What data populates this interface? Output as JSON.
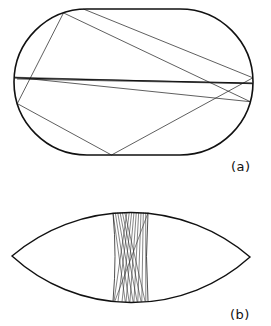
{
  "figure": {
    "panels": [
      {
        "id": "a",
        "label": "(a)",
        "description": "Stadium billiard with chaotic (ergodic) ray trajectories",
        "boundary": {
          "shape": "stadium",
          "left": 14,
          "right": 253,
          "top": 9,
          "bottom": 155,
          "straight_from_x": 87,
          "straight_to_x": 180
        },
        "trajectory": {
          "bounces": 60,
          "start": [
            17,
            79
          ],
          "direction": [
            1.0,
            0.02
          ],
          "stroke": "#1a1a1a"
        }
      },
      {
        "id": "b",
        "label": "(b)",
        "description": "Lens-shaped (two circular arcs) billiard with stable bouncing-ball orbit bundle",
        "boundary": {
          "shape": "lens",
          "left_tip": [
            12,
            256
          ],
          "right_tip": [
            250,
            257
          ],
          "top_y": 212,
          "bottom_y": 302
        },
        "bundle": {
          "top_x_range": [
            113,
            148
          ],
          "bottom_x_range": [
            113,
            148
          ],
          "waist_x_range": [
            117,
            145
          ],
          "ray_count": 16,
          "stroke": "#333333"
        }
      }
    ],
    "colors": {
      "outline": "#111111",
      "rays": "#1a1a1a",
      "background": "#ffffff"
    }
  }
}
